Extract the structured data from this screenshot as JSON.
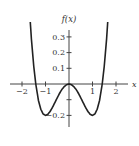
{
  "chart_data": {
    "type": "line",
    "title": "",
    "xlabel": "x",
    "ylabel": "f(x)",
    "function": "f(x) = 0.2x^4 - 0.4x^2",
    "x_ticks": [
      -2,
      -1,
      1,
      2
    ],
    "x_tick_labels": [
      "−2",
      "−1",
      "1",
      "2"
    ],
    "y_ticks": [
      0.3,
      0.2,
      0.1,
      -0.1,
      -0.2
    ],
    "y_tick_labels": [
      "0.3",
      "0.2",
      "0.1",
      "",
      "−0.2"
    ],
    "xlim": [
      -2.3,
      2.3
    ],
    "ylim": [
      -0.28,
      0.38
    ],
    "grid": false,
    "legend": null,
    "series": [
      {
        "name": "f(x)",
        "x": [
          -2.0,
          -1.9,
          -1.8,
          -1.7,
          -1.6,
          -1.5,
          -1.414,
          -1.3,
          -1.2,
          -1.1,
          -1.0,
          -0.9,
          -0.8,
          -0.7,
          -0.6,
          -0.5,
          -0.4,
          -0.3,
          -0.2,
          -0.1,
          0.0,
          0.1,
          0.2,
          0.3,
          0.4,
          0.5,
          0.6,
          0.7,
          0.8,
          0.9,
          1.0,
          1.1,
          1.2,
          1.3,
          1.414,
          1.5,
          1.6,
          1.7,
          1.8,
          1.9,
          2.0
        ],
        "values": [
          1.6,
          1.162,
          0.804,
          0.514,
          0.287,
          0.113,
          0.0,
          -0.105,
          -0.161,
          -0.191,
          -0.2,
          -0.193,
          -0.174,
          -0.148,
          -0.118,
          -0.088,
          -0.059,
          -0.034,
          -0.016,
          -0.004,
          0.0,
          -0.004,
          -0.016,
          -0.034,
          -0.059,
          -0.088,
          -0.118,
          -0.148,
          -0.174,
          -0.193,
          -0.2,
          -0.191,
          -0.161,
          -0.105,
          0.0,
          0.113,
          0.287,
          0.514,
          0.804,
          1.162,
          1.6
        ]
      }
    ],
    "key_points": {
      "local_max": [
        0,
        0
      ],
      "local_mins": [
        [
          -1,
          -0.2
        ],
        [
          1,
          -0.2
        ]
      ],
      "zeros": [
        -1.414,
        0,
        1.414
      ]
    }
  },
  "layout": {
    "origin_px": [
      69,
      84
    ],
    "px_per_x_unit": 23.5,
    "px_per_y_unit": 157,
    "y_axis_top_px": 30,
    "y_axis_bottom_px": 127,
    "x_axis_left_px": 10,
    "x_axis_right_px": 128,
    "curve_color": "#222222",
    "axis_color": "#444444"
  }
}
